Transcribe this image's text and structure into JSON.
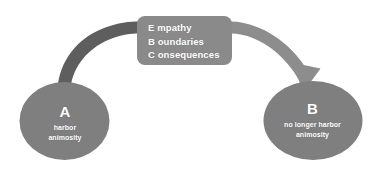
{
  "diagram": {
    "background_color": "#ffffff",
    "nodes": [
      {
        "id": "a",
        "letter": "A",
        "caption_line_1": "harbor",
        "caption_line_2": "animosity",
        "shape": "ellipse",
        "fill_color": "#7f7f7f",
        "text_color": "#ffffff"
      },
      {
        "id": "b",
        "letter": "B",
        "caption_line_1": "no longer harbor",
        "caption_line_2": "animosity",
        "shape": "ellipse",
        "fill_color": "#7f7f7f",
        "text_color": "#ffffff"
      }
    ],
    "intervention_box": {
      "shape": "rounded-rectangle",
      "fill_color": "#8a8a8a",
      "text_color": "#ffffff",
      "lines": [
        "E mpathy",
        "B oundaries",
        "C onsequences"
      ]
    },
    "connectors": [
      {
        "id": "incoming",
        "from": "a",
        "to": "intervention_box",
        "style": "curved-band",
        "color": "#5e5e5e",
        "arrowhead": false
      },
      {
        "id": "outgoing",
        "from": "intervention_box",
        "to": "b",
        "style": "curved-arrow",
        "color": "#8d8d8d",
        "arrowhead": true
      }
    ]
  }
}
